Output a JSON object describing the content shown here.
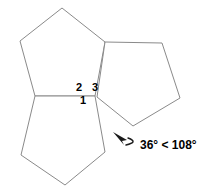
{
  "figure": {
    "background_color": "#ffffff",
    "outline_color": "#8a8a8a",
    "text_color": "#000000",
    "annotation_color": "#1a1a1a",
    "width": 218,
    "height": 192
  },
  "pentagons": [
    {
      "name": "upper-left-pentagon",
      "points": "62,8 20,41 35,96 95,96 105,42"
    },
    {
      "name": "right-pentagon",
      "points": "105,42 162,43 180,98 133,126 97,97"
    },
    {
      "name": "lower-left-pentagon",
      "points": "35,96 95,96 105,152 65,185 21,155"
    }
  ],
  "angle_labels": [
    {
      "id": "1",
      "text": "1"
    },
    {
      "id": "2",
      "text": "2"
    },
    {
      "id": "3",
      "text": "3"
    }
  ],
  "annotation": {
    "text": "36° < 108°",
    "curve_path": "M 126,145 C 134,143 136,141 128,138",
    "arrowhead_points": "113,132 127,140 122,141 124,145"
  }
}
